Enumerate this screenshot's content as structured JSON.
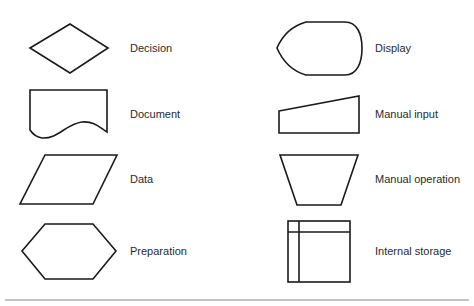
{
  "diagram": {
    "title": "",
    "symbols": [
      {
        "name": "Decision",
        "shape": "diamond",
        "column": "left",
        "row": 1
      },
      {
        "name": "Document",
        "shape": "document",
        "column": "left",
        "row": 2
      },
      {
        "name": "Data",
        "shape": "parallelogram",
        "column": "left",
        "row": 3
      },
      {
        "name": "Preparation",
        "shape": "hexagon",
        "column": "left",
        "row": 4
      },
      {
        "name": "Display",
        "shape": "display",
        "column": "right",
        "row": 1
      },
      {
        "name": "Manual input",
        "shape": "manual-input",
        "column": "right",
        "row": 2
      },
      {
        "name": "Manual operation",
        "shape": "trapezoid",
        "column": "right",
        "row": 3
      },
      {
        "name": "Internal storage",
        "shape": "internal-storage",
        "column": "right",
        "row": 4
      }
    ],
    "colors": {
      "stroke": "#1a1a1a",
      "fill": "#ffffff",
      "text": "#2b2b2b",
      "rule": "#8a8a8a"
    }
  }
}
